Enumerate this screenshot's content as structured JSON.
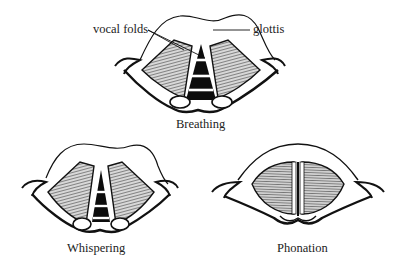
{
  "diagram": {
    "annotations": {
      "vocal_folds": "vocal folds",
      "glottis": "glottis"
    },
    "panels": [
      {
        "id": "breathing",
        "label": "Breathing",
        "glottis_state": "wide open"
      },
      {
        "id": "whispering",
        "label": "Whispering",
        "glottis_state": "partly open (posterior)"
      },
      {
        "id": "phonation",
        "label": "Phonation",
        "glottis_state": "closed / narrow slit"
      }
    ],
    "colors": {
      "ink": "#111111",
      "fold_hatch": "#555555",
      "background": "#ffffff"
    }
  }
}
